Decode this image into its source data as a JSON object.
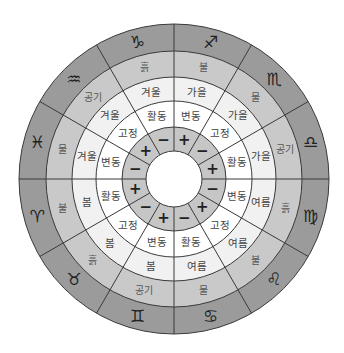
{
  "diagram": {
    "center": [
      174,
      179
    ],
    "radii": {
      "outer": 155,
      "element": 128,
      "season": 102,
      "modality": 78,
      "polarity": 52,
      "hole": 28
    },
    "colors": {
      "sign_ring": "#9b9b9b",
      "element_ring": "#c9c9c9",
      "season_ring": "#f1f1f1",
      "modality_ring": "#ffffff",
      "polarity_ring": "#c6c6c6",
      "hole": "#ffffff",
      "lines": "#3a3a3a"
    },
    "sectors": [
      {
        "sign": "Sagittarius",
        "glyph": "♐",
        "element": "불",
        "season": "가을",
        "modality": "변동",
        "polarity": "+"
      },
      {
        "sign": "Scorpio",
        "glyph": "♏",
        "element": "물",
        "season": "가을",
        "modality": "고정",
        "polarity": "−"
      },
      {
        "sign": "Libra",
        "glyph": "♎",
        "element": "공기",
        "season": "가을",
        "modality": "활동",
        "polarity": "+"
      },
      {
        "sign": "Virgo",
        "glyph": "♍",
        "element": "흙",
        "season": "여름",
        "modality": "변동",
        "polarity": "−"
      },
      {
        "sign": "Leo",
        "glyph": "♌",
        "element": "불",
        "season": "여름",
        "modality": "고정",
        "polarity": "+"
      },
      {
        "sign": "Cancer",
        "glyph": "♋",
        "element": "물",
        "season": "여름",
        "modality": "활동",
        "polarity": "−"
      },
      {
        "sign": "Gemini",
        "glyph": "♊",
        "element": "공기",
        "season": "봄",
        "modality": "변동",
        "polarity": "+"
      },
      {
        "sign": "Taurus",
        "glyph": "♉",
        "element": "흙",
        "season": "봄",
        "modality": "고정",
        "polarity": "−"
      },
      {
        "sign": "Aries",
        "glyph": "♈",
        "element": "불",
        "season": "봄",
        "modality": "활동",
        "polarity": "+"
      },
      {
        "sign": "Pisces",
        "glyph": "♓",
        "element": "물",
        "season": "겨울",
        "modality": "변동",
        "polarity": "−"
      },
      {
        "sign": "Aquarius",
        "glyph": "♒",
        "element": "공기",
        "season": "겨울",
        "modality": "고정",
        "polarity": "+"
      },
      {
        "sign": "Capricorn",
        "glyph": "♑",
        "element": "흙",
        "season": "겨울",
        "modality": "활동",
        "polarity": "−"
      }
    ]
  }
}
